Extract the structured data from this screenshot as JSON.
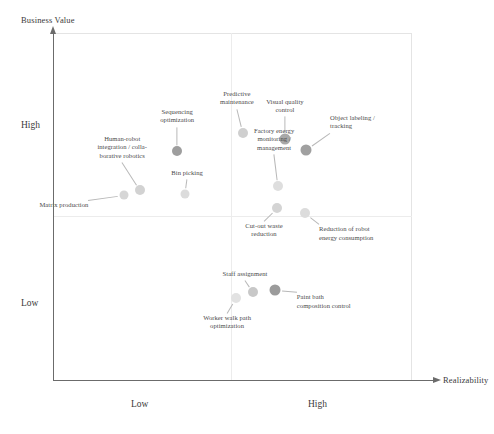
{
  "chart_data": {
    "type": "scatter",
    "title": "",
    "xlabel": "Realizability",
    "ylabel": "Business Value",
    "xtick_labels": [
      "Low",
      "High"
    ],
    "ytick_labels": [
      "High",
      "Low"
    ],
    "grid": true,
    "legend": "none",
    "quadrant_divider_x": "mid",
    "quadrant_divider_y": "mid",
    "points": [
      {
        "label": "Matrix production",
        "x": 0.199,
        "y": 0.535,
        "marker_color": "#d6d6d6",
        "marker_size": 9
      },
      {
        "label": "Human-robot\nintegration / colla-\nborative robotics",
        "x": 0.243,
        "y": 0.548,
        "marker_color": "#d2d2d2",
        "marker_size": 10
      },
      {
        "label": "Sequencing\noptimization",
        "x": 0.346,
        "y": 0.662,
        "marker_color": "#9e9e9e",
        "marker_size": 10
      },
      {
        "label": "Bin picking",
        "x": 0.368,
        "y": 0.537,
        "marker_color": "#dcdcdc",
        "marker_size": 9
      },
      {
        "label": "Predictive\nmaintenance",
        "x": 0.529,
        "y": 0.713,
        "marker_color": "#cfcfcf",
        "marker_size": 10
      },
      {
        "label": "Visual quality\ncontrol",
        "x": 0.646,
        "y": 0.694,
        "marker_color": "#a8a8a8",
        "marker_size": 11
      },
      {
        "label": "Object labeling /\ntracking",
        "x": 0.705,
        "y": 0.665,
        "marker_color": "#a0a0a0",
        "marker_size": 11
      },
      {
        "label": "Factory energy\nmonitoring /\nmanagement",
        "x": 0.627,
        "y": 0.56,
        "marker_color": "#dedede",
        "marker_size": 10
      },
      {
        "label": "Cut-out waste\nreduction",
        "x": 0.624,
        "y": 0.497,
        "marker_color": "#d4d4d4",
        "marker_size": 10
      },
      {
        "label": "Reduction of robot\nenergy consumption",
        "x": 0.702,
        "y": 0.482,
        "marker_color": "#dcdcdc",
        "marker_size": 10
      },
      {
        "label": "Staff assignment",
        "x": 0.557,
        "y": 0.256,
        "marker_color": "#c8c8c8",
        "marker_size": 10
      },
      {
        "label": "Worker walk path\noptimization",
        "x": 0.51,
        "y": 0.239,
        "marker_color": "#e2e2e2",
        "marker_size": 10
      },
      {
        "label": "Paint bath\ncomposition control",
        "x": 0.618,
        "y": 0.261,
        "marker_color": "#9b9b9b",
        "marker_size": 11
      }
    ]
  },
  "axes": {
    "y_title": "Business Value",
    "x_title": "Realizability",
    "y_high": "High",
    "y_low": "Low",
    "x_low": "Low",
    "x_high": "High"
  },
  "colors": {
    "axis": "#6b6b6b",
    "grid": "#ececec",
    "frame": "#e4e4e4",
    "text": "#3a3a3a",
    "leader": "#b8b8b8"
  }
}
